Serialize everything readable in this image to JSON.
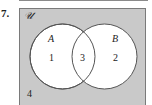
{
  "problem": {
    "number": "7."
  },
  "diagram": {
    "universe_symbol": "𝒰",
    "sets": [
      {
        "name": "A",
        "region_only_value": "1"
      },
      {
        "name": "B",
        "region_only_value": "2"
      }
    ],
    "intersection_value": "3",
    "outside_value": "4",
    "colors": {
      "universe_fill": "#c9c9c9",
      "circle_fill": "#ffffff",
      "stroke": "#555555"
    }
  }
}
